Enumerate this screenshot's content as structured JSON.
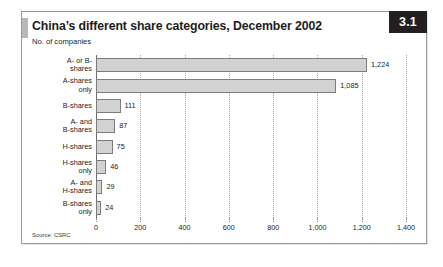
{
  "figure": {
    "number": "3.1",
    "title": "China’s different share categories, December 2002",
    "subtitle": "No. of companies",
    "source": "Source: CSRC"
  },
  "chart_data": {
    "type": "bar",
    "orientation": "horizontal",
    "title": "China’s different share categories, December 2002",
    "subtitle": "No. of companies",
    "xlabel": "",
    "ylabel": "",
    "xlim": [
      0,
      1400
    ],
    "xticks": [
      0,
      200,
      400,
      600,
      800,
      1000,
      1200,
      1400
    ],
    "xtick_labels": [
      "0",
      "200",
      "400",
      "600",
      "800",
      "1,000",
      "1,200",
      "1,400"
    ],
    "grid": true,
    "legend": false,
    "source": "Source: CSRC",
    "bar_color": "#d2d2d2",
    "bar_border_color": "#7c7c7c",
    "categories": [
      "A- or B-shares",
      "A-shares only",
      "B-shares",
      "A- and B-shares",
      "H-shares",
      "H-shares only",
      "A- and H-shares",
      "B-shares only"
    ],
    "category_lines": [
      [
        "A- or B-",
        "shares"
      ],
      [
        "A-shares",
        "only"
      ],
      [
        "B-shares"
      ],
      [
        "A- and",
        "B-shares"
      ],
      [
        "H-shares"
      ],
      [
        "H-shares",
        "only"
      ],
      [
        "A- and",
        "H-shares"
      ],
      [
        "B-shares",
        "only"
      ]
    ],
    "values": [
      1224,
      1085,
      111,
      87,
      75,
      46,
      29,
      24
    ],
    "value_labels": [
      "1,224",
      "1,085",
      "111",
      "87",
      "75",
      "46",
      "29",
      "24"
    ]
  }
}
